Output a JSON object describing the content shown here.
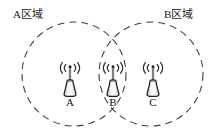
{
  "figure": {
    "kind": "network-coverage-diagram",
    "width": 222,
    "height": 136,
    "background_color": "#ffffff",
    "stroke_color": "#3a3a3a",
    "text_color": "#1a1a1a"
  },
  "regions": [
    {
      "id": "A",
      "label": "A区域",
      "center_x": 74,
      "center_y": 74,
      "radius": 52,
      "line_style": "dashed",
      "label_x": 13,
      "label_y": 9
    },
    {
      "id": "B",
      "label": "B区域",
      "center_x": 151,
      "center_y": 74,
      "radius": 52,
      "line_style": "dashed",
      "label_x": 164,
      "label_y": 9
    }
  ],
  "towers": [
    {
      "id": "A",
      "letter": "A",
      "x": 70,
      "y": 74,
      "icon": "cell-tower-icon",
      "signal_icon": "broadcast-signal-icon",
      "in_regions": [
        "A"
      ]
    },
    {
      "id": "B",
      "letter": "B",
      "x": 113,
      "y": 74,
      "icon": "cell-tower-icon",
      "signal_icon": "broadcast-signal-icon",
      "in_regions": [
        "A",
        "B"
      ]
    },
    {
      "id": "C",
      "letter": "C",
      "x": 153,
      "y": 74,
      "icon": "cell-tower-icon",
      "signal_icon": "broadcast-signal-icon",
      "in_regions": [
        "B"
      ]
    }
  ]
}
